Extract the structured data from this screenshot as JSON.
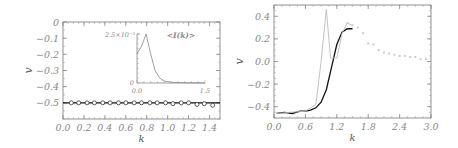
{
  "chart_data": [
    {
      "type": "scatter",
      "title": "",
      "xlabel": "k",
      "ylabel": "v",
      "xlim": [
        0.0,
        1.5
      ],
      "ylim": [
        -0.6,
        0.0
      ],
      "xticks": [
        "0.0",
        "0.2",
        "0.4",
        "0.6",
        "0.8",
        "1.0",
        "1.2",
        "1.4"
      ],
      "yticks": [
        "0",
        "-0.1",
        "-0.2",
        "-0.3",
        "-0.4",
        "-0.5"
      ],
      "series": [
        {
          "name": "line",
          "style": "solid-black",
          "x": [
            0.0,
            1.5
          ],
          "y": [
            -0.5,
            -0.5
          ]
        },
        {
          "name": "diamonds",
          "style": "diamond-markers",
          "x": [
            0.08,
            0.15,
            0.23,
            0.3,
            0.38,
            0.45,
            0.53,
            0.6,
            0.68,
            0.75,
            0.83,
            0.9,
            0.98,
            1.05,
            1.13,
            1.2,
            1.28,
            1.35,
            1.43
          ],
          "y": [
            -0.5,
            -0.5,
            -0.5,
            -0.5,
            -0.5,
            -0.5,
            -0.5,
            -0.5,
            -0.5,
            -0.5,
            -0.5,
            -0.5,
            -0.5,
            -0.505,
            -0.5,
            -0.5,
            -0.51,
            -0.505,
            -0.515
          ]
        }
      ],
      "inset": {
        "title": "<I(k)>",
        "ytick_top": "2.5×10⁻⁵",
        "ytick_bottom": "0",
        "xticks": [
          "0.0",
          "1.5"
        ],
        "x": [
          0.0,
          0.1,
          0.2,
          0.3,
          0.4,
          0.5,
          0.6,
          0.8,
          1.0,
          1.2,
          1.5
        ],
        "y": [
          0.6,
          0.75,
          1.0,
          0.6,
          0.25,
          0.1,
          0.04,
          0.01,
          0.005,
          0.002,
          0.0
        ]
      }
    },
    {
      "type": "line",
      "title": "",
      "xlabel": "k",
      "ylabel": "v",
      "xlim": [
        0.0,
        3.0
      ],
      "ylim": [
        -0.5,
        0.5
      ],
      "xticks": [
        "0.0",
        "0.6",
        "1.2",
        "1.8",
        "2.4",
        "3.0"
      ],
      "yticks": [
        "0.4",
        "0.2",
        "0.0",
        "-0.2",
        "-0.4"
      ],
      "series": [
        {
          "name": "black",
          "style": "solid-black",
          "x": [
            0.05,
            0.2,
            0.35,
            0.5,
            0.6,
            0.7,
            0.8,
            0.9,
            1.0,
            1.1,
            1.2,
            1.3,
            1.4,
            1.5
          ],
          "y": [
            -0.46,
            -0.45,
            -0.46,
            -0.44,
            -0.44,
            -0.43,
            -0.41,
            -0.36,
            -0.25,
            -0.05,
            0.15,
            0.26,
            0.29,
            0.29
          ]
        },
        {
          "name": "gray",
          "style": "solid-lightgray",
          "x": [
            0.05,
            0.3,
            0.6,
            0.8,
            0.9,
            1.0,
            1.08,
            1.2,
            1.3,
            1.4,
            1.5
          ],
          "y": [
            -0.46,
            -0.45,
            -0.44,
            -0.38,
            0.0,
            0.46,
            0.03,
            0.03,
            0.25,
            0.34,
            0.32
          ]
        },
        {
          "name": "dotted",
          "style": "dotted-lightgray",
          "x": [
            1.4,
            1.5,
            1.6,
            1.7,
            1.8,
            1.9,
            2.0,
            2.1,
            2.2,
            2.3,
            2.4,
            2.5,
            2.6,
            2.7,
            2.8,
            2.9,
            3.0
          ],
          "y": [
            0.34,
            0.32,
            0.3,
            0.25,
            0.16,
            0.15,
            0.1,
            0.08,
            0.07,
            0.06,
            0.05,
            0.05,
            0.04,
            0.04,
            0.02,
            0.02,
            0.02
          ]
        }
      ]
    }
  ]
}
